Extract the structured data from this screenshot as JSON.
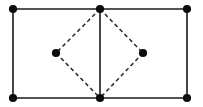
{
  "figure": {
    "background_color": "#ffffff",
    "solid_stroke_color": "#1a1a1a",
    "dashed_stroke_color": "#2b2b2b",
    "vertex_color": "#0d0d0d",
    "canvas": {
      "width": 203,
      "height": 107
    },
    "solid_stroke_width": 1.6,
    "dashed_stroke_width": 1.5,
    "dash_pattern": "4 3",
    "vertex_radius": 4.1,
    "vertices": [
      {
        "id": "top-left",
        "label": "",
        "x": 13,
        "y": 9,
        "role": "rectangle-corner"
      },
      {
        "id": "top-middle",
        "label": "",
        "x": 100,
        "y": 9,
        "role": "rhombus-apex-top"
      },
      {
        "id": "top-right",
        "label": "",
        "x": 187,
        "y": 9,
        "role": "rectangle-corner"
      },
      {
        "id": "left-middle",
        "label": "",
        "x": 56,
        "y": 53,
        "role": "rhombus-apex-left"
      },
      {
        "id": "right-middle",
        "label": "",
        "x": 143,
        "y": 53,
        "role": "rhombus-apex-right"
      },
      {
        "id": "bottom-left",
        "label": "",
        "x": 13,
        "y": 98,
        "role": "rectangle-corner"
      },
      {
        "id": "bottom-middle",
        "label": "",
        "x": 100,
        "y": 98,
        "role": "rhombus-apex-bottom"
      },
      {
        "id": "bottom-right",
        "label": "",
        "x": 187,
        "y": 98,
        "role": "rectangle-corner"
      }
    ],
    "solid_edges": [
      {
        "id": "rect-top",
        "from": "top-left",
        "to": "top-right",
        "x1": 13,
        "y1": 9,
        "x2": 187,
        "y2": 9
      },
      {
        "id": "rect-bottom",
        "from": "bottom-left",
        "to": "bottom-right",
        "x1": 13,
        "y1": 98,
        "x2": 187,
        "y2": 98
      },
      {
        "id": "rect-left",
        "from": "top-left",
        "to": "bottom-left",
        "x1": 13,
        "y1": 9,
        "x2": 13,
        "y2": 98
      },
      {
        "id": "rect-right",
        "from": "top-right",
        "to": "bottom-right",
        "x1": 187,
        "y1": 9,
        "x2": 187,
        "y2": 98
      },
      {
        "id": "vertical-median",
        "from": "top-middle",
        "to": "bottom-middle",
        "x1": 100,
        "y1": 9,
        "x2": 100,
        "y2": 98
      }
    ],
    "dashed_edges": [
      {
        "id": "rhombus-top-left",
        "from": "top-middle",
        "to": "left-middle",
        "x1": 100,
        "y1": 9,
        "x2": 56,
        "y2": 53
      },
      {
        "id": "rhombus-top-right",
        "from": "top-middle",
        "to": "right-middle",
        "x1": 100,
        "y1": 9,
        "x2": 143,
        "y2": 53
      },
      {
        "id": "rhombus-bottom-left",
        "from": "left-middle",
        "to": "bottom-middle",
        "x1": 56,
        "y1": 53,
        "x2": 100,
        "y2": 98
      },
      {
        "id": "rhombus-bottom-right",
        "from": "right-middle",
        "to": "bottom-middle",
        "x1": 143,
        "y1": 53,
        "x2": 100,
        "y2": 98
      }
    ]
  }
}
